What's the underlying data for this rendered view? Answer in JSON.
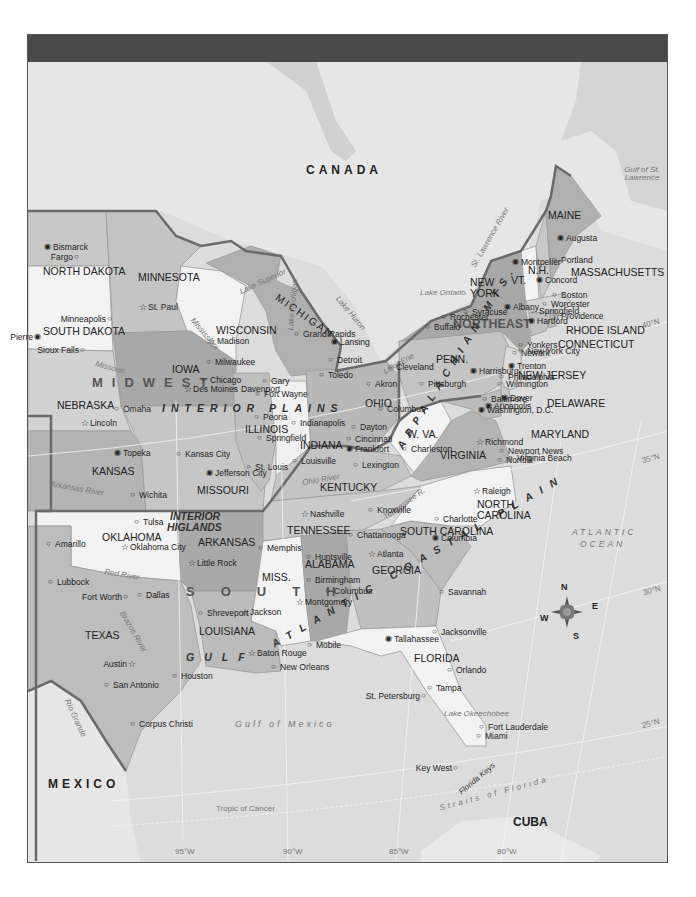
{
  "map": {
    "title": "",
    "countries": {
      "canada": "CANADA",
      "mexico": "MEXICO",
      "cuba": "CUBA"
    },
    "regions": {
      "midwest": "MIDWEST",
      "northeast": "NORTHEAST",
      "south": "SOUTH",
      "interior_plains": "INTERIOR PLAINS",
      "interior_highlands_1": "INTERIOR",
      "interior_highlands_2": "HIGLANDS",
      "appalachian": "APPALACHIAN MTS.",
      "atlantic_coastal": "ATLANTIC COASTAL PLAIN",
      "gulf": "GULF"
    },
    "states": {
      "north_dakota": "NORTH DAKOTA",
      "south_dakota": "SOUTH DAKOTA",
      "minnesota": "MINNESOTA",
      "wisconsin": "WISCONSIN",
      "michigan": "MICHIGAN",
      "iowa": "IOWA",
      "nebraska": "NEBRASKA",
      "kansas": "KANSAS",
      "missouri": "MISSOURI",
      "illinois": "ILLINOIS",
      "indiana": "INDIANA",
      "ohio": "OHIO",
      "kentucky": "KENTUCKY",
      "tennessee": "TENNESSEE",
      "oklahoma": "OKLAHOMA",
      "arkansas": "ARKANSAS",
      "texas": "TEXAS",
      "louisiana": "LOUISIANA",
      "mississippi": "MISS.",
      "alabama": "ALABAMA",
      "georgia": "GEORGIA",
      "florida": "FLORIDA",
      "south_carolina": "SOUTH CAROLINA",
      "north_carolina_1": "NORTH",
      "north_carolina_2": "CAROLINA",
      "virginia": "VIRGINIA",
      "west_virginia": "W. VA.",
      "maryland": "MARYLAND",
      "delaware": "DELAWARE",
      "new_jersey": "NEW JERSEY",
      "pennsylvania": "PENN.",
      "new_york_1": "NEW",
      "new_york_2": "YORK",
      "vermont": "VT.",
      "new_hampshire": "N.H.",
      "maine": "MAINE",
      "massachusetts": "MASSACHUSETTS",
      "rhode_island": "RHODE ISLAND",
      "connecticut": "CONNECTICUT"
    },
    "cities": [
      {
        "name": "Bismarck",
        "x": 48,
        "y": 248,
        "type": "capital"
      },
      {
        "name": "Fargo",
        "x": 78,
        "y": 258,
        "type": "city",
        "left": true
      },
      {
        "name": "Pierre",
        "x": 38,
        "y": 338,
        "type": "capital",
        "left": true
      },
      {
        "name": "Sioux Falls",
        "x": 84,
        "y": 351,
        "type": "city",
        "left": true
      },
      {
        "name": "Minneapolis",
        "x": 111,
        "y": 320,
        "type": "city",
        "left": true
      },
      {
        "name": "St. Paul",
        "x": 143,
        "y": 308,
        "type": "star"
      },
      {
        "name": "Madison",
        "x": 212,
        "y": 342,
        "type": "star"
      },
      {
        "name": "Milwaukee",
        "x": 210,
        "y": 363,
        "type": "city"
      },
      {
        "name": "Chicago",
        "x": 205,
        "y": 381,
        "type": "city"
      },
      {
        "name": "Gary",
        "x": 266,
        "y": 382,
        "type": "city"
      },
      {
        "name": "Fort Wayne",
        "x": 259,
        "y": 395,
        "type": "city"
      },
      {
        "name": "Grand Rapids",
        "x": 298,
        "y": 335,
        "type": "city"
      },
      {
        "name": "Lansing",
        "x": 335,
        "y": 343,
        "type": "capital"
      },
      {
        "name": "Detroit",
        "x": 332,
        "y": 361,
        "type": "city"
      },
      {
        "name": "Toledo",
        "x": 323,
        "y": 376,
        "type": "city"
      },
      {
        "name": "Cleveland",
        "x": 391,
        "y": 368,
        "type": "city"
      },
      {
        "name": "Akron",
        "x": 370,
        "y": 385,
        "type": "city"
      },
      {
        "name": "Columbus",
        "x": 382,
        "y": 410,
        "type": "city"
      },
      {
        "name": "Dayton",
        "x": 355,
        "y": 428,
        "type": "city"
      },
      {
        "name": "Cincinnati",
        "x": 350,
        "y": 440,
        "type": "city"
      },
      {
        "name": "Indianapolis",
        "x": 295,
        "y": 424,
        "type": "city"
      },
      {
        "name": "Louisville",
        "x": 296,
        "y": 462,
        "type": "city"
      },
      {
        "name": "Frankfort",
        "x": 350,
        "y": 450,
        "type": "capital"
      },
      {
        "name": "Lexington",
        "x": 357,
        "y": 466,
        "type": "city"
      },
      {
        "name": "Charleston",
        "x": 406,
        "y": 450,
        "type": "city"
      },
      {
        "name": "Des Moines",
        "x": 188,
        "y": 390,
        "type": "star"
      },
      {
        "name": "Davenport",
        "x": 236,
        "y": 390,
        "type": "city"
      },
      {
        "name": "Peoria",
        "x": 258,
        "y": 418,
        "type": "city"
      },
      {
        "name": "Springfield",
        "x": 261,
        "y": 439,
        "type": "city"
      },
      {
        "name": "St. Louis",
        "x": 250,
        "y": 468,
        "type": "city"
      },
      {
        "name": "Omaha",
        "x": 118,
        "y": 410,
        "type": "city"
      },
      {
        "name": "Lincoln",
        "x": 85,
        "y": 424,
        "type": "star"
      },
      {
        "name": "Topeka",
        "x": 118,
        "y": 454,
        "type": "capital"
      },
      {
        "name": "Kansas City",
        "x": 180,
        "y": 455,
        "type": "city"
      },
      {
        "name": "Jefferson City",
        "x": 210,
        "y": 474,
        "type": "capital"
      },
      {
        "name": "Wichita",
        "x": 134,
        "y": 496,
        "type": "city"
      },
      {
        "name": "Tulsa",
        "x": 138,
        "y": 523,
        "type": "city"
      },
      {
        "name": "Oklahoma City",
        "x": 125,
        "y": 548,
        "type": "star"
      },
      {
        "name": "Amarillo",
        "x": 50,
        "y": 545,
        "type": "city"
      },
      {
        "name": "Little Rock",
        "x": 192,
        "y": 564,
        "type": "star"
      },
      {
        "name": "Memphis",
        "x": 262,
        "y": 549,
        "type": "city"
      },
      {
        "name": "Nashville",
        "x": 305,
        "y": 515,
        "type": "star"
      },
      {
        "name": "Knoxville",
        "x": 372,
        "y": 511,
        "type": "city"
      },
      {
        "name": "Chattanooga",
        "x": 352,
        "y": 536,
        "type": "city"
      },
      {
        "name": "Huntsville",
        "x": 310,
        "y": 558,
        "type": "city"
      },
      {
        "name": "Birmingham",
        "x": 310,
        "y": 581,
        "type": "city"
      },
      {
        "name": "Atlanta",
        "x": 372,
        "y": 555,
        "type": "star"
      },
      {
        "name": "Columbus",
        "x": 329,
        "y": 592,
        "type": "city"
      },
      {
        "name": "Montgomery",
        "x": 300,
        "y": 603,
        "type": "star"
      },
      {
        "name": "Jackson",
        "x": 245,
        "y": 613,
        "type": "star"
      },
      {
        "name": "Mobile",
        "x": 311,
        "y": 646,
        "type": "city"
      },
      {
        "name": "Shreveport",
        "x": 202,
        "y": 614,
        "type": "city"
      },
      {
        "name": "Baton Rouge",
        "x": 252,
        "y": 654,
        "type": "star"
      },
      {
        "name": "New Orleans",
        "x": 275,
        "y": 668,
        "type": "city"
      },
      {
        "name": "Charlotte",
        "x": 438,
        "y": 520,
        "type": "city"
      },
      {
        "name": "Columbia",
        "x": 436,
        "y": 539,
        "type": "capital"
      },
      {
        "name": "Savannah",
        "x": 443,
        "y": 593,
        "type": "city"
      },
      {
        "name": "Jacksonville",
        "x": 436,
        "y": 633,
        "type": "city"
      },
      {
        "name": "Tallahassee",
        "x": 389,
        "y": 640,
        "type": "capital"
      },
      {
        "name": "Orlando",
        "x": 451,
        "y": 671,
        "type": "city"
      },
      {
        "name": "Tampa",
        "x": 431,
        "y": 689,
        "type": "city"
      },
      {
        "name": "St. Petersburg",
        "x": 425,
        "y": 697,
        "type": "city",
        "left": true
      },
      {
        "name": "Fort Lauderdale",
        "x": 483,
        "y": 728,
        "type": "city"
      },
      {
        "name": "Miami",
        "x": 480,
        "y": 737,
        "type": "city"
      },
      {
        "name": "Key West",
        "x": 457,
        "y": 769,
        "type": "city",
        "left": true
      },
      {
        "name": "Lubbock",
        "x": 52,
        "y": 583,
        "type": "city"
      },
      {
        "name": "Fort Worth",
        "x": 127,
        "y": 598,
        "type": "city",
        "left": true
      },
      {
        "name": "Dallas",
        "x": 141,
        "y": 596,
        "type": "city"
      },
      {
        "name": "Austin",
        "x": 132,
        "y": 665,
        "type": "star",
        "left": true
      },
      {
        "name": "San Antonio",
        "x": 108,
        "y": 686,
        "type": "city"
      },
      {
        "name": "Houston",
        "x": 176,
        "y": 677,
        "type": "city"
      },
      {
        "name": "Corpus Christi",
        "x": 134,
        "y": 725,
        "type": "city"
      },
      {
        "name": "Richmond",
        "x": 480,
        "y": 443,
        "type": "star"
      },
      {
        "name": "Newport News",
        "x": 503,
        "y": 452,
        "type": "city"
      },
      {
        "name": "Virginia Beach",
        "x": 512,
        "y": 459,
        "type": "city"
      },
      {
        "name": "Norfolk",
        "x": 501,
        "y": 461,
        "type": "city"
      },
      {
        "name": "Raleigh",
        "x": 477,
        "y": 492,
        "type": "star"
      },
      {
        "name": "Pittsburgh",
        "x": 423,
        "y": 385,
        "type": "city"
      },
      {
        "name": "Harrisburg",
        "x": 474,
        "y": 372,
        "type": "capital"
      },
      {
        "name": "Philadelphia",
        "x": 503,
        "y": 378,
        "type": "city"
      },
      {
        "name": "Wilmington",
        "x": 501,
        "y": 385,
        "type": "city"
      },
      {
        "name": "Baltimore",
        "x": 486,
        "y": 400,
        "type": "city"
      },
      {
        "name": "Dover",
        "x": 505,
        "y": 399,
        "type": "capital"
      },
      {
        "name": "Annapolis",
        "x": 489,
        "y": 407,
        "type": "capital"
      },
      {
        "name": "Washington, D.C.",
        "x": 482,
        "y": 411,
        "type": "capital"
      },
      {
        "name": "Trenton",
        "x": 512,
        "y": 367,
        "type": "capital"
      },
      {
        "name": "Newark",
        "x": 516,
        "y": 354,
        "type": "city"
      },
      {
        "name": "New York City",
        "x": 522,
        "y": 352,
        "type": "city"
      },
      {
        "name": "Yonkers",
        "x": 522,
        "y": 346,
        "type": "city"
      },
      {
        "name": "Buffalo",
        "x": 429,
        "y": 328,
        "type": "city"
      },
      {
        "name": "Rochester",
        "x": 445,
        "y": 318,
        "type": "city"
      },
      {
        "name": "Syracuse",
        "x": 467,
        "y": 313,
        "type": "city"
      },
      {
        "name": "Albany",
        "x": 508,
        "y": 308,
        "type": "capital"
      },
      {
        "name": "Springfield",
        "x": 534,
        "y": 312,
        "type": "city"
      },
      {
        "name": "Hartford",
        "x": 532,
        "y": 322,
        "type": "capital"
      },
      {
        "name": "Montpelier",
        "x": 516,
        "y": 263,
        "type": "capital"
      },
      {
        "name": "Concord",
        "x": 540,
        "y": 281,
        "type": "capital"
      },
      {
        "name": "Augusta",
        "x": 561,
        "y": 239,
        "type": "capital"
      },
      {
        "name": "Portland",
        "x": 556,
        "y": 261,
        "type": "city"
      },
      {
        "name": "Boston",
        "x": 556,
        "y": 296,
        "type": "city"
      },
      {
        "name": "Worcester",
        "x": 546,
        "y": 305,
        "type": "city"
      },
      {
        "name": "Providence",
        "x": 556,
        "y": 317,
        "type": "star"
      }
    ],
    "water": {
      "lake_superior": "Lake Superior",
      "lake_michigan": "Lake Michigan",
      "lake_huron": "Lake Huron",
      "lake_erie": "Lake Erie",
      "lake_ontario": "Lake Ontario",
      "lake_okeechobee": "Lake Okeechobee",
      "st_lawrence_river": "St. Lawrence River",
      "gulf_st_lawrence": "Gulf of St. Lawrence",
      "mississippi": "Mississippi",
      "missouri": "Missouri",
      "ohio_river": "Ohio River",
      "tennessee_river": "Tennessee R.",
      "arkansas_river": "Arkansas River",
      "red_river": "Red River",
      "brazos_river": "Brazos River",
      "rio_grande": "Rio Grande",
      "iowa_river": "Iowa",
      "gulf_of_mexico": "Gulf of Mexico",
      "atlantic_1": "ATLANTIC",
      "atlantic_2": "OCEAN",
      "straits_florida": "Straits of Florida",
      "florida_keys": "Florida Keys",
      "tropic_cancer": "Tropic of Cancer"
    },
    "coords": {
      "lat40": "40°N",
      "lat35": "35°N",
      "lat30": "30°N",
      "lat25": "25°N",
      "lon95": "95°W",
      "lon90": "90°W",
      "lon85": "85°W",
      "lon80": "80°W"
    },
    "compass": {
      "n": "N",
      "e": "E",
      "s": "S",
      "w": "W"
    },
    "colors": {
      "header": "#4a4a4a",
      "water": "#dcdcdc",
      "land_foreign": "#e6e6e6",
      "state_dark": "#a9a9a9",
      "state_mid": "#bdbdbd",
      "state_light": "#d2d2d2",
      "state_white": "#f2f2f2",
      "region_border": "#666666"
    }
  }
}
